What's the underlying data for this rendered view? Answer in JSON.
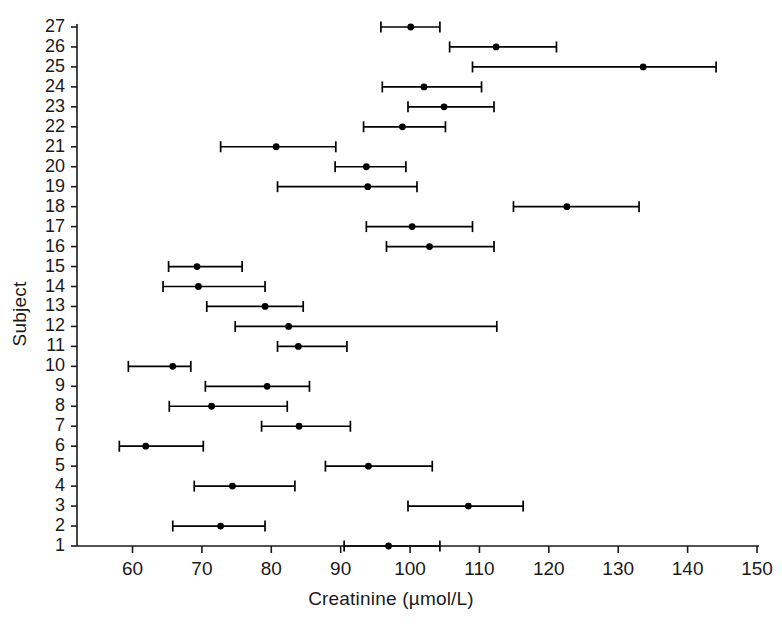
{
  "chart_data": {
    "type": "scatter",
    "title": "",
    "xlabel": "Creatinine (µmol/L)",
    "ylabel": "Subject",
    "xlim": [
      52,
      150
    ],
    "xticks": [
      60,
      70,
      80,
      90,
      100,
      110,
      120,
      130,
      140,
      150
    ],
    "ylim": [
      0.4,
      27.6
    ],
    "yticks": [
      1,
      2,
      3,
      4,
      5,
      6,
      7,
      8,
      9,
      10,
      11,
      12,
      13,
      14,
      15,
      16,
      17,
      18,
      19,
      20,
      21,
      22,
      23,
      24,
      25,
      26,
      27
    ],
    "grid": false,
    "legend": null,
    "marker": "filled-circle",
    "errorbar_style": "horizontal-range-with-end-caps",
    "series": [
      {
        "name": "Creatinine mean with range",
        "categories": [
          "1",
          "2",
          "3",
          "4",
          "5",
          "6",
          "7",
          "8",
          "9",
          "10",
          "11",
          "12",
          "13",
          "14",
          "15",
          "16",
          "17",
          "18",
          "19",
          "20",
          "21",
          "22",
          "23",
          "24",
          "25",
          "26",
          "27"
        ],
        "points": [
          {
            "subject": 1,
            "mean": 96.9,
            "low": 90.5,
            "high": 104.3
          },
          {
            "subject": 2,
            "mean": 72.7,
            "low": 65.8,
            "high": 79.1
          },
          {
            "subject": 3,
            "mean": 108.4,
            "low": 99.7,
            "high": 116.3
          },
          {
            "subject": 4,
            "mean": 74.4,
            "low": 68.9,
            "high": 83.4
          },
          {
            "subject": 5,
            "mean": 94.0,
            "low": 87.8,
            "high": 103.2
          },
          {
            "subject": 6,
            "mean": 61.9,
            "low": 58.1,
            "high": 70.2
          },
          {
            "subject": 7,
            "mean": 84.0,
            "low": 78.6,
            "high": 91.4
          },
          {
            "subject": 8,
            "mean": 71.4,
            "low": 65.3,
            "high": 82.3
          },
          {
            "subject": 9,
            "mean": 79.4,
            "low": 70.5,
            "high": 85.5
          },
          {
            "subject": 10,
            "mean": 65.8,
            "low": 59.4,
            "high": 68.4
          },
          {
            "subject": 11,
            "mean": 83.9,
            "low": 80.9,
            "high": 90.9
          },
          {
            "subject": 12,
            "mean": 82.5,
            "low": 74.8,
            "high": 112.5
          },
          {
            "subject": 13,
            "mean": 79.1,
            "low": 70.7,
            "high": 84.6
          },
          {
            "subject": 14,
            "mean": 69.5,
            "low": 64.4,
            "high": 79.1
          },
          {
            "subject": 15,
            "mean": 69.3,
            "low": 65.2,
            "high": 75.8
          },
          {
            "subject": 16,
            "mean": 102.8,
            "low": 96.6,
            "high": 112.1
          },
          {
            "subject": 17,
            "mean": 100.3,
            "low": 93.7,
            "high": 109.0
          },
          {
            "subject": 18,
            "mean": 122.6,
            "low": 114.9,
            "high": 133.0
          },
          {
            "subject": 19,
            "mean": 93.9,
            "low": 80.9,
            "high": 101.0
          },
          {
            "subject": 20,
            "mean": 93.7,
            "low": 89.2,
            "high": 99.4
          },
          {
            "subject": 21,
            "mean": 80.7,
            "low": 72.7,
            "high": 89.3
          },
          {
            "subject": 22,
            "mean": 98.9,
            "low": 93.3,
            "high": 105.1
          },
          {
            "subject": 23,
            "mean": 104.9,
            "low": 99.7,
            "high": 112.1
          },
          {
            "subject": 24,
            "mean": 102.0,
            "low": 96.0,
            "high": 110.3
          },
          {
            "subject": 25,
            "mean": 133.6,
            "low": 109.0,
            "high": 144.1
          },
          {
            "subject": 26,
            "mean": 112.4,
            "low": 105.7,
            "high": 121.1
          },
          {
            "subject": 27,
            "mean": 100.1,
            "low": 95.8,
            "high": 104.3
          }
        ]
      }
    ]
  },
  "colors": {
    "axis": "#1a1a1a",
    "marker": "#000000",
    "errorbar": "#000000",
    "background": "#ffffff"
  }
}
